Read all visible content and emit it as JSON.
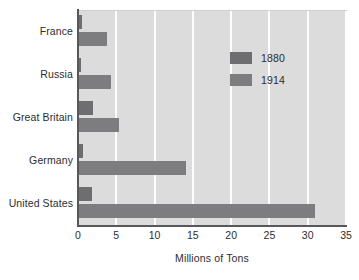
{
  "chart_data": {
    "type": "bar",
    "orientation": "horizontal",
    "title": "",
    "xlabel": "Millions of Tons",
    "ylabel": "",
    "categories": [
      "France",
      "Russia",
      "Great Britain",
      "Germany",
      "United States"
    ],
    "series": [
      {
        "name": "1880",
        "color": "#6e6e70",
        "values": [
          0.5,
          0.4,
          2.0,
          0.7,
          1.8
        ]
      },
      {
        "name": "1914",
        "color": "#7d7d7f",
        "values": [
          3.8,
          4.3,
          5.4,
          14.1,
          31.0
        ]
      }
    ],
    "xlim": [
      0,
      35
    ],
    "xticks": [
      0,
      5,
      10,
      15,
      20,
      25,
      30,
      35
    ],
    "xtick_labels": [
      "0",
      "5",
      "10",
      "15",
      "20",
      "25",
      "30",
      "35"
    ],
    "grid": "vertical-white",
    "legend_position": "upper-right-inside",
    "plot_background": "#dcdcdc",
    "gridline_color": "#fdfdfd",
    "axis_color": "#58585a",
    "text_color": "#2d2d2f",
    "page_background": "#ffffff"
  }
}
